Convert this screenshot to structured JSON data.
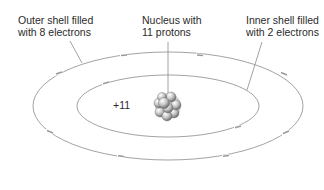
{
  "diagram": {
    "labels": {
      "outer_shell": [
        "Outer shell filled",
        "with 8 electrons"
      ],
      "nucleus": [
        "Nucleus with",
        "11 protons"
      ],
      "inner_shell": [
        "Inner shell filled",
        "with 2 electrons"
      ],
      "nucleus_charge": "+11"
    },
    "shells": [
      {
        "name": "inner",
        "electron_count": 2
      },
      {
        "name": "outer",
        "electron_count": 8
      }
    ],
    "colors": {
      "line": "#8a8a8a",
      "electron": "#9a9a9a",
      "text": "#2a2a2a",
      "nucleus": "#b0b0b0"
    }
  }
}
